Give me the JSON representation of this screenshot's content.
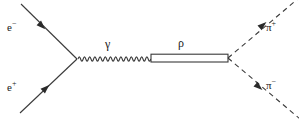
{
  "diagram": {
    "type": "feynman-diagram",
    "background_color": "#ffffff",
    "line_color": "#3a3a3a",
    "text_color": "#1a1a1a"
  },
  "labels": {
    "electron": {
      "base": "e",
      "charge": "−"
    },
    "positron": {
      "base": "e",
      "charge": "+"
    },
    "photon": {
      "base": "γ",
      "charge": ""
    },
    "rho": {
      "base": "ρ",
      "charge": ""
    },
    "pion_plus": {
      "base": "π",
      "charge": "+"
    },
    "pion_minus": {
      "base": "π",
      "charge": "−"
    }
  },
  "geometry": {
    "left_vertex": {
      "x": 77,
      "y": 59
    },
    "right_vertex": {
      "x": 228,
      "y": 58
    },
    "electron_line": {
      "x1": 21,
      "y1": 4,
      "x2": 77,
      "y2": 59
    },
    "positron_line": {
      "x1": 20,
      "y1": 113,
      "x2": 77,
      "y2": 59
    },
    "photon_line": {
      "x1": 78,
      "y1": 59,
      "x2": 151,
      "y2": 59,
      "cycles": 14,
      "amplitude": 4.2
    },
    "rho_line": {
      "x1": 151,
      "y1": 58,
      "x2": 228,
      "y2": 58,
      "gap": 4
    },
    "pion_plus_line": {
      "x1": 228,
      "y1": 58,
      "x2": 299,
      "y2": -2
    },
    "pion_minus_line": {
      "x1": 228,
      "y1": 58,
      "x2": 299,
      "y2": 118
    },
    "arrows": [
      {
        "name": "electron-arrow",
        "x": 42,
        "y": 26,
        "angle": 44.5
      },
      {
        "name": "positron-arrow",
        "x": 46,
        "y": 88,
        "angle": -43.5
      },
      {
        "name": "pion-plus-arrow",
        "x": 263,
        "y": 25,
        "angle": -40.2
      },
      {
        "name": "pion-minus-arrow",
        "x": 258,
        "y": 87,
        "angle": 40.2
      }
    ]
  }
}
